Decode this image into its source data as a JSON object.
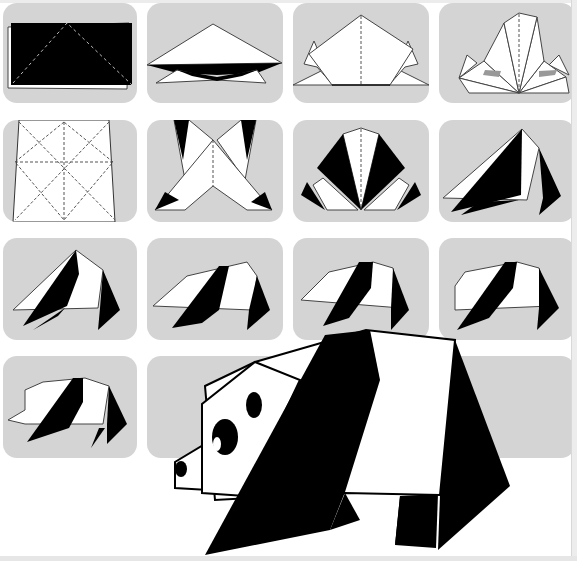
{
  "colors": {
    "panel_background": "#d4d4d4",
    "paper_white": "#ffffff",
    "paper_black": "#000000",
    "outline": "#333333",
    "fold_line": "#555555"
  },
  "steps": [
    {
      "number": 1,
      "label": "Step 1",
      "description": "Black rectangle with dashed diagonal fold lines forming a triangle"
    },
    {
      "number": 2,
      "label": "Step 2",
      "description": "Folded into a wide triangle, bow-tie shape beneath"
    },
    {
      "number": 3,
      "label": "Step 3",
      "description": "Pentagon shape with side flaps and center dashed line"
    },
    {
      "number": 4,
      "label": "Step 4",
      "description": "Fan of pointed petals with center dashed line"
    },
    {
      "number": 5,
      "label": "Step 5",
      "description": "White square with dashed crease pattern (diagonals and midlines)"
    },
    {
      "number": 6,
      "label": "Step 6",
      "description": "Folded base with black corner triangles"
    },
    {
      "number": 7,
      "label": "Step 7",
      "description": "Fan with black outer petals and white center"
    },
    {
      "number": 8,
      "label": "Step 8",
      "description": "Body shape begins, black and white panels"
    },
    {
      "number": 9,
      "label": "Step 9",
      "description": "Body shape with black stripe and legs"
    },
    {
      "number": 10,
      "label": "Step 10",
      "description": "Body flattened with black stripe"
    },
    {
      "number": 11,
      "label": "Step 11",
      "description": "Body with head shaping"
    },
    {
      "number": 12,
      "label": "Step 12",
      "description": "Body with rounded head corner"
    },
    {
      "number": 13,
      "label": "Step 13",
      "description": "Head and snout formed"
    },
    {
      "number": 14,
      "label": "Finished panda",
      "description": "Completed origami panda with eyes, ear and nose"
    }
  ]
}
